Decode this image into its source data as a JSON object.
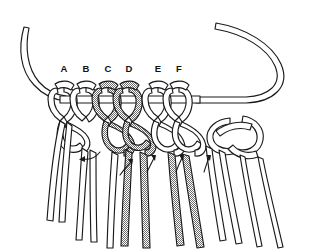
{
  "figure": {
    "type": "line-drawing-instructional",
    "width": 314,
    "height": 251,
    "background_color": "#ffffff",
    "ink_color": "#1a1a1a",
    "shaded_cord_color": "#9a9a9a",
    "cropped_caption_fragment": "",
    "labels": [
      {
        "text": "A",
        "x": 64,
        "y": 72
      },
      {
        "text": "B",
        "x": 86,
        "y": 72
      },
      {
        "text": "C",
        "x": 108,
        "y": 72
      },
      {
        "text": "D",
        "x": 129,
        "y": 72
      },
      {
        "text": "E",
        "x": 158,
        "y": 72
      },
      {
        "text": "F",
        "x": 179,
        "y": 72
      }
    ],
    "holding_cord": {
      "name": "holding-cord",
      "description": "Horizontal mounting cord running across the figure, curving up and out at both ends",
      "shaded": false
    },
    "mounted_knots": [
      {
        "id": "knot-A",
        "label": "A",
        "x": 64,
        "shaded": false
      },
      {
        "id": "knot-B",
        "label": "B",
        "x": 86,
        "shaded": false
      },
      {
        "id": "knot-C",
        "label": "C",
        "x": 108,
        "shaded": true
      },
      {
        "id": "knot-D",
        "label": "D",
        "x": 129,
        "shaded": true
      },
      {
        "id": "knot-E",
        "label": "E",
        "x": 158,
        "shaded": false
      },
      {
        "id": "knot-F",
        "label": "F",
        "x": 179,
        "shaded": false
      }
    ],
    "direction_arrows": [
      {
        "id": "arrow-1",
        "x": 90,
        "y": 160,
        "direction": "left-curl"
      },
      {
        "id": "arrow-2",
        "x": 129,
        "y": 166,
        "direction": "up-curl"
      },
      {
        "id": "arrow-3",
        "x": 152,
        "y": 160,
        "direction": "up-curl"
      },
      {
        "id": "arrow-4",
        "x": 180,
        "y": 160,
        "direction": "up-curl"
      },
      {
        "id": "arrow-5",
        "x": 208,
        "y": 158,
        "direction": "up-curl"
      }
    ],
    "hanging_cord_count": 12,
    "shaded_hanging_cords": 4
  }
}
